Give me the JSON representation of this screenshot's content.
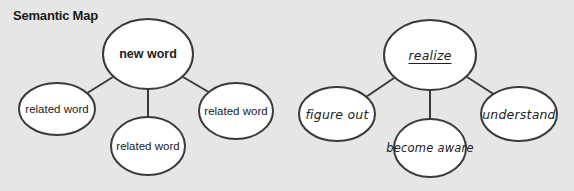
{
  "title": "Semantic Map",
  "colors": {
    "background": "#e6e6e6",
    "ellipse_fill": "#ffffff",
    "stroke": "#3a3a3a",
    "text": "#222222"
  },
  "maps": [
    {
      "name": "template",
      "center": {
        "label": "new word",
        "cx": 148,
        "cy": 54,
        "rx": 45,
        "ry": 35
      },
      "related": [
        {
          "label": "related word",
          "cx": 57,
          "cy": 109,
          "rx": 38,
          "ry": 26
        },
        {
          "label": "related word",
          "cx": 148,
          "cy": 146,
          "rx": 37,
          "ry": 29
        },
        {
          "label": "related word",
          "cx": 236,
          "cy": 111,
          "rx": 37,
          "ry": 28
        }
      ]
    },
    {
      "name": "example",
      "center": {
        "label": "realize",
        "cx": 430,
        "cy": 55,
        "rx": 46,
        "ry": 35
      },
      "related": [
        {
          "label": "figure out",
          "cx": 337,
          "cy": 114,
          "rx": 38,
          "ry": 27
        },
        {
          "label": "become aware",
          "cx": 430,
          "cy": 148,
          "rx": 36,
          "ry": 29
        },
        {
          "label": "understand",
          "cx": 519,
          "cy": 114,
          "rx": 38,
          "ry": 27
        }
      ]
    }
  ]
}
